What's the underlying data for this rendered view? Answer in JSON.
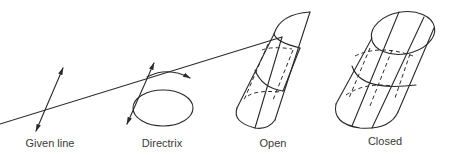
{
  "figure": {
    "panels": [
      {
        "id": "given-line",
        "label": "Given line"
      },
      {
        "id": "directrix",
        "label": "Directrix"
      },
      {
        "id": "open",
        "label": "Open"
      },
      {
        "id": "closed",
        "label": "Closed"
      }
    ]
  },
  "colors": {
    "line": "#2a2a2a",
    "text": "#3a3a3a",
    "background": "#ffffff"
  }
}
